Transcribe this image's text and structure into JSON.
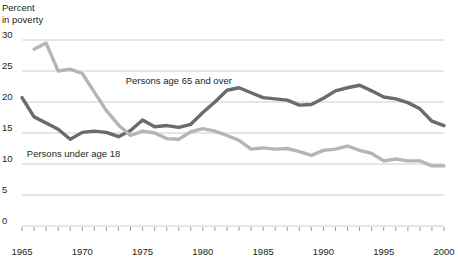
{
  "chart_data": {
    "type": "line",
    "title": "",
    "ylabel": "Percent\nin poverty",
    "xlabel": "",
    "ylim": [
      0,
      30
    ],
    "xlim": [
      1965,
      2000
    ],
    "yticks": [
      0,
      5,
      10,
      15,
      20,
      25,
      30
    ],
    "ytick_labels": [
      "0",
      "5",
      "10",
      "15",
      "20",
      "25",
      "30"
    ],
    "xticks": [
      1965,
      1970,
      1975,
      1980,
      1985,
      1990,
      1995,
      2000
    ],
    "xtick_labels": [
      "1965",
      "1970",
      "1975",
      "1980",
      "1985",
      "1990",
      "1995",
      "2000"
    ],
    "minor_xticks_every": 1,
    "grid": "horizontal",
    "legend_position": "inline-annotations",
    "colors": {
      "under18": "#6b6b6b",
      "over65": "#b5b5b5",
      "gridline": "#cccccc",
      "axis_text": "#231f20"
    },
    "series": [
      {
        "name": "Persons under age 18",
        "color": "#6b6b6b",
        "label_x": 1965.4,
        "label_y": 11.6,
        "x": [
          1965,
          1966,
          1967,
          1968,
          1969,
          1970,
          1971,
          1972,
          1973,
          1974,
          1975,
          1976,
          1977,
          1978,
          1979,
          1980,
          1981,
          1982,
          1983,
          1984,
          1985,
          1986,
          1987,
          1988,
          1989,
          1990,
          1991,
          1992,
          1993,
          1994,
          1995,
          1996,
          1997,
          1998,
          1999,
          2000
        ],
        "values": [
          20.7,
          17.6,
          16.6,
          15.6,
          14.0,
          15.1,
          15.3,
          15.1,
          14.4,
          15.4,
          17.1,
          16.0,
          16.2,
          15.9,
          16.4,
          18.3,
          20.0,
          21.9,
          22.3,
          21.5,
          20.7,
          20.5,
          20.3,
          19.5,
          19.6,
          20.6,
          21.8,
          22.3,
          22.7,
          21.8,
          20.8,
          20.5,
          19.9,
          18.9,
          16.9,
          16.2
        ]
      },
      {
        "name": "Persons age 65 and over",
        "color": "#b5b5b5",
        "label_x": 1973.6,
        "label_y": 23.4,
        "x": [
          1966,
          1967,
          1968,
          1969,
          1970,
          1971,
          1972,
          1973,
          1974,
          1975,
          1976,
          1977,
          1978,
          1979,
          1980,
          1981,
          1982,
          1983,
          1984,
          1985,
          1986,
          1987,
          1988,
          1989,
          1990,
          1991,
          1992,
          1993,
          1994,
          1995,
          1996,
          1997,
          1998,
          1999,
          2000
        ],
        "values": [
          28.5,
          29.5,
          25.0,
          25.3,
          24.6,
          21.6,
          18.6,
          16.3,
          14.6,
          15.3,
          15.0,
          14.1,
          14.0,
          15.2,
          15.7,
          15.3,
          14.6,
          13.8,
          12.4,
          12.6,
          12.4,
          12.5,
          12.0,
          11.4,
          12.2,
          12.4,
          12.9,
          12.2,
          11.7,
          10.5,
          10.8,
          10.5,
          10.5,
          9.7,
          9.7
        ]
      }
    ]
  }
}
